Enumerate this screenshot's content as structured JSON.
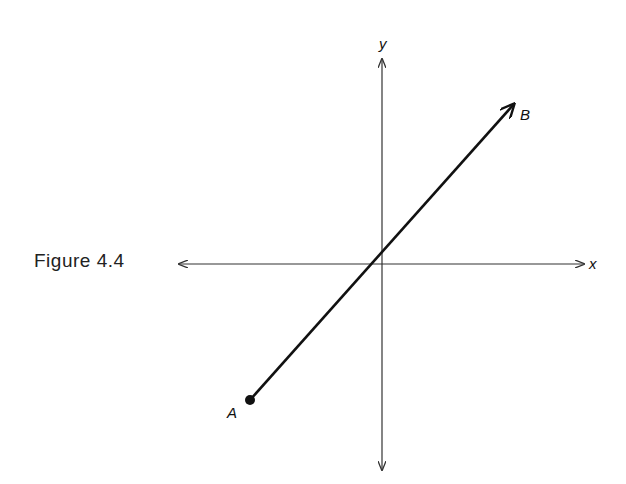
{
  "figure": {
    "caption": "Figure 4.4",
    "axes": {
      "x_label": "x",
      "y_label": "y"
    },
    "vector": {
      "start_label": "A",
      "end_label": "B"
    }
  },
  "colors": {
    "ink": "#111111",
    "axis": "#333333",
    "background": "#ffffff"
  }
}
